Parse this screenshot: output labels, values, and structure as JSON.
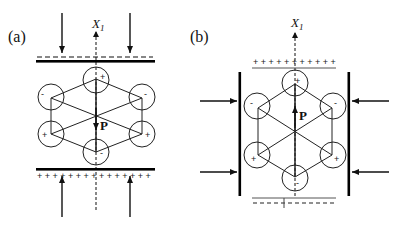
{
  "panels": [
    {
      "label": "(a)",
      "axis_label": "X",
      "axis_subscript": "1",
      "polarization_label": "P",
      "polarization_direction": "down",
      "atom_charges": {
        "top": "+",
        "upper_left": "-",
        "upper_right": "-",
        "lower_left": "+",
        "lower_right": "+",
        "bottom": "-"
      },
      "top_surface_charges": "- - - - - - - - - - - - - - - -",
      "bottom_surface_charges": "+ + + + + + + + + + + + + + +",
      "force": "vertical compression"
    },
    {
      "label": "(b)",
      "axis_label": "X",
      "axis_subscript": "1",
      "polarization_label": "P",
      "polarization_direction": "up",
      "atom_charges": {
        "top": "+",
        "upper_left": "-",
        "upper_right": "-",
        "lower_left": "+",
        "lower_right": "+",
        "bottom": "-"
      },
      "top_surface_charges": "+ + + + + + + + + + +",
      "bottom_surface_charges": "- - - - - - - - - - -",
      "force": "horizontal compression"
    }
  ],
  "colors": {
    "ink": "#111111",
    "plate": "#000000",
    "thin": "#555555"
  }
}
